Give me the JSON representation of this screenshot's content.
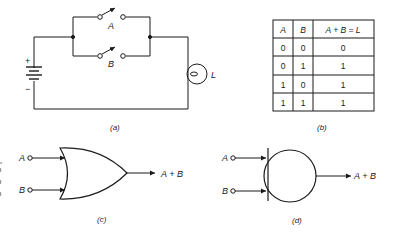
{
  "figure": {
    "panel_a": {
      "caption": "(a)",
      "switch_a_label": "A",
      "switch_b_label": "B",
      "battery_plus": "+",
      "battery_minus": "−",
      "lamp_label": "L"
    },
    "panel_b": {
      "caption": "(b)",
      "headers": [
        "A",
        "B",
        "A + B = L"
      ],
      "rows": [
        [
          "0",
          "0",
          "0"
        ],
        [
          "0",
          "1",
          "1"
        ],
        [
          "1",
          "0",
          "1"
        ],
        [
          "1",
          "1",
          "1"
        ]
      ]
    },
    "panel_c": {
      "caption": "(c)",
      "input_a": "A",
      "input_b": "B",
      "output": "A + B"
    },
    "panel_d": {
      "caption": "(d)",
      "input_a": "A",
      "input_b": "B",
      "output": "A + B"
    },
    "colors": {
      "line": "#1a1a1a",
      "background": "#ffffff"
    }
  }
}
